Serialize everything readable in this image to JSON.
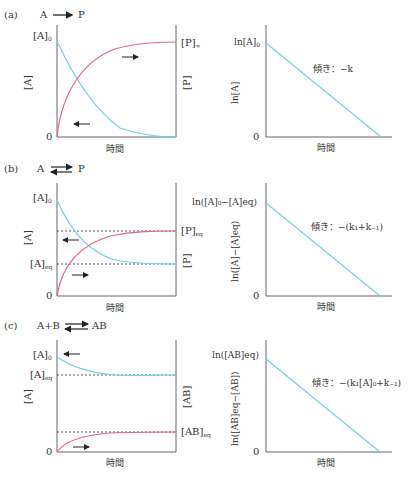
{
  "figure": {
    "colors": {
      "reactant_A": "#6fd3e0",
      "product": "#e8628a",
      "axis": "#555555",
      "arrow": "#222222",
      "dashed": "#333333"
    },
    "panels": [
      {
        "id": "a",
        "label": "(a)",
        "reaction": {
          "left": "A",
          "right": "P",
          "arrow": "forward"
        },
        "concentration_plot": {
          "y_left_label": "[A]",
          "y_right_label": "[P]",
          "y_top_left": "[A]",
          "y_top_left_sub": "0",
          "y_top_right": "[P]",
          "y_top_right_sub": "∞",
          "origin": "0",
          "x_label": "時間"
        },
        "log_plot": {
          "y_label": "ln[A]",
          "y_intercept": "ln[A]",
          "y_intercept_sub": "0",
          "origin": "0",
          "x_label": "時間",
          "slope_label": "傾き：−k"
        }
      },
      {
        "id": "b",
        "label": "(b)",
        "reaction": {
          "left": "A",
          "right": "P",
          "arrow": "equilibrium"
        },
        "concentration_plot": {
          "y_left_label": "[A]",
          "y_right_label": "[P]",
          "y_top_left": "[A]",
          "y_top_left_sub": "0",
          "y_eq_left": "[A]",
          "y_eq_left_sub": "eq",
          "y_eq_right": "[P]",
          "y_eq_right_sub": "eq",
          "origin": "0",
          "x_label": "時間"
        },
        "log_plot": {
          "y_label": "ln([A]−[A]eq)",
          "y_intercept": "ln([A]₀−[A]eq)",
          "origin": "0",
          "x_label": "時間",
          "slope_label": "傾き：−(k₁+k₋₁)"
        }
      },
      {
        "id": "c",
        "label": "(c)",
        "reaction": {
          "left": "A+B",
          "right": "AB",
          "arrow": "equilibrium"
        },
        "concentration_plot": {
          "y_left_label": "[A]",
          "y_right_label": "[AB]",
          "y_top_left": "[A]",
          "y_top_left_sub": "0",
          "y_eq_left": "[A]",
          "y_eq_left_sub": "eq",
          "y_eq_right": "[AB]",
          "y_eq_right_sub": "eq",
          "origin": "0",
          "x_label": "時間"
        },
        "log_plot": {
          "y_label": "ln([AB]eq−[AB])",
          "y_intercept": "ln([AB]eq)",
          "origin": "0",
          "x_label": "時間",
          "slope_label": "傾き：−(k₁[A]₀+k₋₁)"
        }
      }
    ]
  }
}
